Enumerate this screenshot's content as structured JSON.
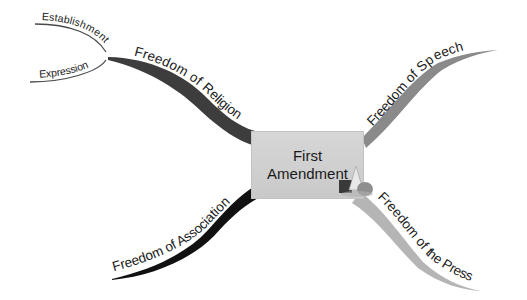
{
  "central_topic": {
    "line1": "First",
    "line2": "Amendment",
    "fill_color": "#d2d2d2",
    "icon": "shapes-icon"
  },
  "branches": [
    {
      "id": "religion",
      "label": "Freedom of Religion",
      "color": "#3d3d3d",
      "side": "top-left",
      "children": [
        {
          "label": "Establishment"
        },
        {
          "label": "Expression"
        }
      ]
    },
    {
      "id": "speech",
      "label": "Freedom of Speech",
      "color": "#8a8a8a",
      "side": "top-right",
      "children": []
    },
    {
      "id": "association",
      "label": "Freedom of Association",
      "color": "#111111",
      "side": "bottom-left",
      "children": []
    },
    {
      "id": "press",
      "label": "Freedom of the Press",
      "color": "#b5b5b5",
      "side": "bottom-right",
      "children": []
    }
  ],
  "subbranch_color": "#4a4a4a"
}
